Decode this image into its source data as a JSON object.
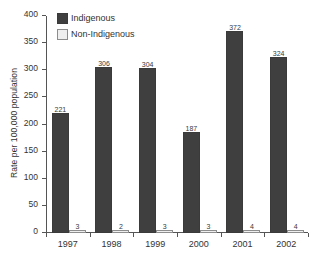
{
  "chart_data": {
    "type": "bar",
    "title": "",
    "subtitle": "",
    "xlabel": "",
    "ylabel": "Rate per 100,000 population",
    "categories": [
      "1997",
      "1998",
      "1999",
      "2000",
      "2001",
      "2002"
    ],
    "series": [
      {
        "name": "Indigenous",
        "color": "#3f3f3f",
        "values": [
          221,
          306,
          304,
          187,
          372,
          324
        ],
        "labels": [
          "221",
          "306",
          "304",
          "187",
          "372",
          "324"
        ]
      },
      {
        "name": "Non-Indigenous",
        "color": "#efefef",
        "values": [
          3,
          2,
          3,
          3,
          4,
          4
        ],
        "labels": [
          "3",
          "2",
          "3",
          "3",
          "4",
          "4"
        ]
      }
    ],
    "ylim": [
      0,
      400
    ],
    "yticks": [
      0,
      50,
      100,
      150,
      200,
      250,
      300,
      350,
      400
    ],
    "ytick_labels": [
      "0",
      "50",
      "100",
      "150",
      "200",
      "250",
      "300",
      "350",
      "400"
    ],
    "grid": false,
    "legend_position": "top-left",
    "legend_entries": [
      "Indigenous",
      "Non-Indigenous"
    ]
  },
  "axes": {
    "y_title": "Rate per 100,000 population"
  },
  "legend": {
    "items": [
      {
        "label": "Indigenous",
        "swatch": "filled-dark-square-icon"
      },
      {
        "label": "Non-Indigenous",
        "swatch": "outlined-light-square-icon"
      }
    ]
  }
}
